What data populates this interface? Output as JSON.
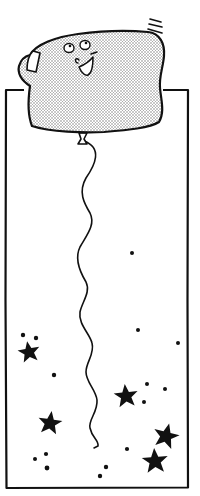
{
  "illustration": {
    "caption": "Smiling toast-shaped balloon floating above a tall starry frame",
    "colors": {
      "ink": "#111111",
      "paper": "#ffffff",
      "stipple": "#8a8a8a"
    },
    "frame": {
      "x": 6,
      "y": 90,
      "width": 182,
      "height": 398
    },
    "balloon": {
      "shape": "slice-of-bread",
      "face": {
        "eyes": 2,
        "nose": "curl",
        "mouth": "open-smile"
      },
      "motion_lines": 3
    },
    "stars": [
      {
        "cx": 29,
        "cy": 352,
        "r": 11
      },
      {
        "cx": 50,
        "cy": 423,
        "r": 12
      },
      {
        "cx": 126,
        "cy": 396,
        "r": 12
      },
      {
        "cx": 166,
        "cy": 436,
        "r": 13
      },
      {
        "cx": 155,
        "cy": 461,
        "r": 13
      }
    ],
    "dots": [
      {
        "cx": 132,
        "cy": 253
      },
      {
        "cx": 23,
        "cy": 335
      },
      {
        "cx": 36,
        "cy": 338
      },
      {
        "cx": 138,
        "cy": 330
      },
      {
        "cx": 178,
        "cy": 343
      },
      {
        "cx": 54,
        "cy": 375
      },
      {
        "cx": 147,
        "cy": 384
      },
      {
        "cx": 165,
        "cy": 389
      },
      {
        "cx": 144,
        "cy": 402
      },
      {
        "cx": 127,
        "cy": 449
      },
      {
        "cx": 35,
        "cy": 459
      },
      {
        "cx": 46,
        "cy": 454
      },
      {
        "cx": 47,
        "cy": 468
      },
      {
        "cx": 106,
        "cy": 467
      },
      {
        "cx": 100,
        "cy": 476
      }
    ]
  }
}
